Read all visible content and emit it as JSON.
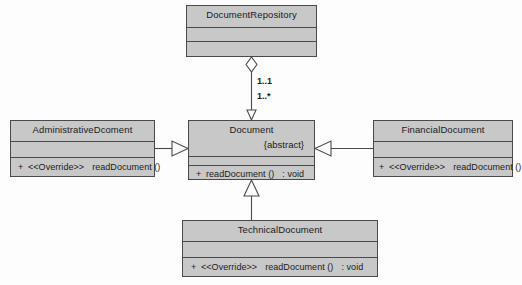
{
  "diagram": {
    "type": "uml-class-diagram",
    "background_color": "#fdfdfd",
    "class_fill_color": "#c8c8c8",
    "line_color": "#4a4a4a"
  },
  "classes": {
    "document_repository": {
      "name": "DocumentRepository",
      "attributes": [],
      "methods": []
    },
    "document": {
      "name": "Document",
      "stereotype": "{abstract}",
      "attributes": [],
      "methods": [
        {
          "visibility": "+",
          "annotation": "",
          "signature": "readDocument ()",
          "return_type": ": void"
        }
      ]
    },
    "administrative_document": {
      "name": "AdministrativeDcoment",
      "attributes": [],
      "methods": [
        {
          "visibility": "+",
          "annotation": "<<Override>>",
          "signature": "readDocument ()",
          "return_type": ""
        }
      ]
    },
    "financial_document": {
      "name": "FinancialDocument",
      "attributes": [],
      "methods": [
        {
          "visibility": "+",
          "annotation": "<<Override>>",
          "signature": "readDocument ()",
          "return_type": ""
        }
      ]
    },
    "technical_document": {
      "name": "TechnicalDocument",
      "attributes": [],
      "methods": [
        {
          "visibility": "+",
          "annotation": "<<Override>>",
          "signature": "readDocument ()",
          "return_type": ": void"
        }
      ]
    }
  },
  "relationships": {
    "aggregation": {
      "from": "DocumentRepository",
      "to": "Document",
      "source_multiplicity": "1..1",
      "target_multiplicity": "1..*",
      "marker": "hollow-diamond"
    },
    "generalizations": [
      {
        "from": "AdministrativeDcoment",
        "to": "Document",
        "marker": "hollow-triangle"
      },
      {
        "from": "FinancialDocument",
        "to": "Document",
        "marker": "hollow-triangle"
      },
      {
        "from": "TechnicalDocument",
        "to": "Document",
        "marker": "hollow-triangle"
      }
    ]
  }
}
